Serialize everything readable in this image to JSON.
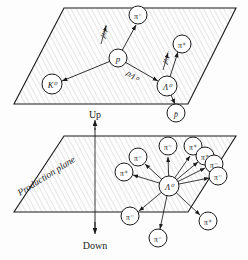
{
  "figure": {
    "title_top_panel": "Decay plane",
    "title_bottom_panel": "Production plane",
    "direction_up": "Up",
    "direction_down": "Down",
    "production_plane_label": "Production plane",
    "colors": {
      "stroke": "#1a1a1a",
      "hatch": "#9a9a9a",
      "background": "#fdfdfd",
      "label": "#1a1a1a"
    }
  },
  "top_panel": {
    "particles": [
      {
        "id": "pi-top",
        "label": "π⁻",
        "cx": 138,
        "cy": 15,
        "r": 9
      },
      {
        "id": "pi-right",
        "label": "π⁺",
        "cx": 182,
        "cy": 44,
        "r": 9
      },
      {
        "id": "proton-center",
        "label": "p",
        "cx": 118,
        "cy": 58,
        "r": 9
      },
      {
        "id": "kaon-zero",
        "label": "K⁰",
        "cx": 52,
        "cy": 84,
        "r": 10
      },
      {
        "id": "lambda-zero",
        "label": "Λ⁰",
        "cx": 167,
        "cy": 86,
        "r": 10
      },
      {
        "id": "antiproton",
        "label": "p̄",
        "cx": 176,
        "cy": 113,
        "r": 9
      }
    ],
    "momentum_labels": [
      {
        "id": "p-sigma",
        "text": "pπ⁺",
        "x": 104,
        "y": 36
      },
      {
        "id": "p-lambda",
        "text": "pΛ⁰",
        "x": 130,
        "y": 76
      },
      {
        "id": "p-pi",
        "text": "pπ⁻",
        "x": 164,
        "y": 62
      }
    ]
  },
  "bottom_panel": {
    "vertex": {
      "id": "lambda-zero-vertex",
      "label": "Λ⁰",
      "cx": 169,
      "cy": 186,
      "r": 10
    },
    "pions": [
      {
        "label": "π⁻",
        "cx": 168,
        "cy": 146,
        "r": 9
      },
      {
        "label": "π⁺",
        "cx": 193,
        "cy": 146,
        "r": 9
      },
      {
        "label": "π⁻",
        "cx": 138,
        "cy": 157,
        "r": 9
      },
      {
        "label": "π⁺",
        "cx": 205,
        "cy": 156,
        "r": 9
      },
      {
        "label": "π⁻",
        "cx": 214,
        "cy": 164,
        "r": 9
      },
      {
        "label": "π⁻",
        "cx": 218,
        "cy": 176,
        "r": 9
      },
      {
        "label": "π⁺",
        "cx": 124,
        "cy": 172,
        "r": 9
      },
      {
        "label": "π⁻",
        "cx": 130,
        "cy": 216,
        "r": 9
      },
      {
        "label": "π⁺",
        "cx": 208,
        "cy": 221,
        "r": 9
      },
      {
        "label": "π⁻",
        "cx": 158,
        "cy": 238,
        "r": 9
      }
    ]
  }
}
